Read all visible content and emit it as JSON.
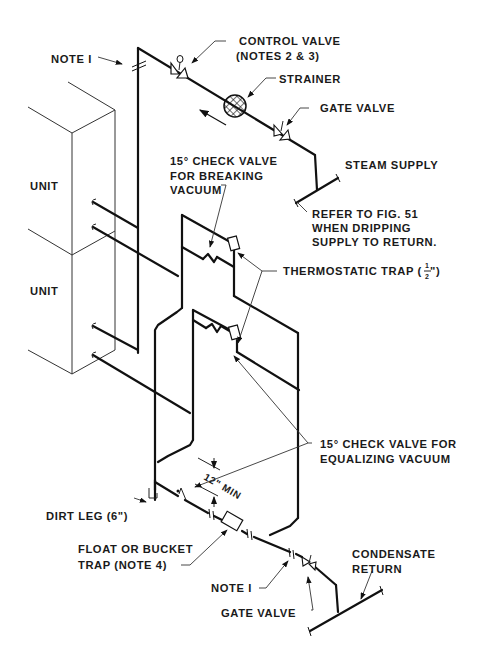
{
  "diagram": {
    "labels": {
      "note1_top": "NOTE I",
      "control_valve_1": "CONTROL VALVE",
      "control_valve_2": "(NOTES 2 & 3)",
      "strainer": "STRAINER",
      "gate_valve_top": "GATE VALVE",
      "steam_supply": "STEAM SUPPLY",
      "check_vacuum_1": "15° CHECK VALVE",
      "check_vacuum_2": "FOR BREAKING",
      "check_vacuum_3": "VACUUM",
      "refer_1": "REFER TO FIG. 51",
      "refer_2": "WHEN DRIPPING",
      "refer_3": "SUPPLY TO RETURN.",
      "unit_upper": "UNIT",
      "unit_lower": "UNIT",
      "thermostatic_trap": "THERMOSTATIC TRAP (",
      "thermostatic_trap_size_num": "1",
      "thermostatic_trap_size_den": "2",
      "thermostatic_trap_close": "\")",
      "min_clearance": "12\" MIN",
      "check_equalize_1": "15° CHECK VALVE FOR",
      "check_equalize_2": "EQUALIZING VACUUM",
      "dirt_leg": "DIRT LEG (6\")",
      "float_trap_1": "FLOAT OR BUCKET",
      "float_trap_2": "TRAP (NOTE 4)",
      "note1_bottom": "NOTE I",
      "gate_valve_bottom": "GATE VALVE",
      "condensate_1": "CONDENSATE",
      "condensate_2": "RETURN"
    },
    "components": [
      {
        "name": "control-valve",
        "type": "valve"
      },
      {
        "name": "strainer",
        "type": "strainer"
      },
      {
        "name": "gate-valve-supply",
        "type": "gate-valve"
      },
      {
        "name": "check-valve-breaking-vacuum",
        "type": "check-valve",
        "angle": "15°"
      },
      {
        "name": "thermostatic-trap-upper",
        "type": "thermostatic-trap",
        "size": "1/2\""
      },
      {
        "name": "thermostatic-trap-lower",
        "type": "thermostatic-trap",
        "size": "1/2\""
      },
      {
        "name": "check-valve-equalizing-upper",
        "type": "check-valve",
        "angle": "15°"
      },
      {
        "name": "check-valve-equalizing-lower",
        "type": "check-valve",
        "angle": "15°"
      },
      {
        "name": "dirt-leg",
        "type": "dirt-leg",
        "size": "6\""
      },
      {
        "name": "float-bucket-trap",
        "type": "trap"
      },
      {
        "name": "gate-valve-return",
        "type": "gate-valve"
      },
      {
        "name": "unit-upper",
        "type": "unit"
      },
      {
        "name": "unit-lower",
        "type": "unit"
      }
    ]
  }
}
